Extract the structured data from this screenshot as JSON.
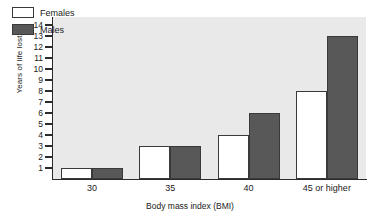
{
  "chart_data": {
    "type": "bar",
    "title": "",
    "xlabel": "Body mass index (BMI)",
    "ylabel": "Years of life lost",
    "categories": [
      "30",
      "35",
      "40",
      "45 or higher"
    ],
    "series": [
      {
        "name": "Females",
        "values": [
          1,
          3,
          4,
          8
        ],
        "color": "#ffffff"
      },
      {
        "name": "Males",
        "values": [
          1,
          3,
          6,
          13
        ],
        "color": "#585858"
      }
    ],
    "ylim": [
      0,
      14
    ],
    "yticks": [
      1,
      2,
      3,
      4,
      5,
      6,
      7,
      8,
      9,
      10,
      11,
      12,
      13,
      14
    ],
    "ytick_labels": [
      "1",
      "2",
      "3",
      "4",
      "5",
      "6",
      "7",
      "8",
      "9",
      "10",
      "11",
      "12",
      "13",
      "14"
    ],
    "grid": false,
    "legend_position": "top-left-inside",
    "plot_background": "#e9e9e9",
    "page_background": "#ffffff"
  },
  "legend": {
    "entries": [
      {
        "label": "Females"
      },
      {
        "label": "Males"
      }
    ]
  },
  "axes": {
    "y_title": "Years of life lost",
    "x_title": "Body mass index (BMI)"
  }
}
